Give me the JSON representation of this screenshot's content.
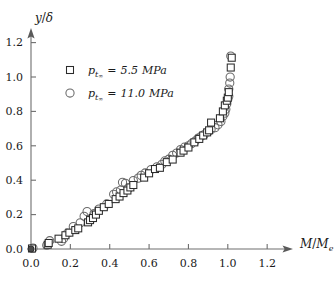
{
  "chart_data": {
    "type": "scatter",
    "title": "",
    "xlabel": "M/M_e",
    "ylabel": "y/δ",
    "xlim": [
      0.0,
      1.3
    ],
    "ylim": [
      0.0,
      1.27
    ],
    "xticks": [
      "0.0",
      "0.2",
      "0.4",
      "0.6",
      "0.8",
      "1.0",
      "1.2"
    ],
    "xtick_values": [
      0.0,
      0.2,
      0.4,
      0.6,
      0.8,
      1.0,
      1.2
    ],
    "yticks": [
      "0.0",
      "0.2",
      "0.4",
      "0.6",
      "0.8",
      "1.0",
      "1.2"
    ],
    "ytick_values": [
      0.0,
      0.2,
      0.4,
      0.6,
      0.8,
      1.0,
      1.2
    ],
    "grid": false,
    "legend_position": "upper-left",
    "axis_style": "arrow-terminated",
    "series": [
      {
        "name": "p_t∞ = 5.5 MPa",
        "marker": "open-square",
        "points": [
          [
            0.005,
            0.003
          ],
          [
            0.085,
            0.025
          ],
          [
            0.09,
            0.035
          ],
          [
            0.14,
            0.06
          ],
          [
            0.175,
            0.08
          ],
          [
            0.195,
            0.095
          ],
          [
            0.225,
            0.11
          ],
          [
            0.24,
            0.12
          ],
          [
            0.29,
            0.155
          ],
          [
            0.3,
            0.168
          ],
          [
            0.315,
            0.18
          ],
          [
            0.33,
            0.2
          ],
          [
            0.345,
            0.222
          ],
          [
            0.37,
            0.243
          ],
          [
            0.395,
            0.262
          ],
          [
            0.43,
            0.29
          ],
          [
            0.45,
            0.305
          ],
          [
            0.47,
            0.325
          ],
          [
            0.49,
            0.34
          ],
          [
            0.505,
            0.358
          ],
          [
            0.52,
            0.372
          ],
          [
            0.575,
            0.415
          ],
          [
            0.6,
            0.44
          ],
          [
            0.63,
            0.465
          ],
          [
            0.655,
            0.472
          ],
          [
            0.69,
            0.505
          ],
          [
            0.72,
            0.52
          ],
          [
            0.76,
            0.56
          ],
          [
            0.775,
            0.572
          ],
          [
            0.8,
            0.59
          ],
          [
            0.83,
            0.62
          ],
          [
            0.855,
            0.64
          ],
          [
            0.875,
            0.66
          ],
          [
            0.895,
            0.678
          ],
          [
            0.905,
            0.69
          ],
          [
            0.915,
            0.735
          ],
          [
            0.96,
            0.76
          ],
          [
            0.975,
            0.8
          ],
          [
            0.985,
            0.835
          ],
          [
            0.995,
            0.862
          ],
          [
            1.0,
            0.88
          ],
          [
            1.005,
            0.912
          ],
          [
            1.015,
            1.055
          ],
          [
            1.02,
            1.112
          ]
        ]
      },
      {
        "name": "p_t∞ = 11.0 MPa",
        "marker": "open-circle",
        "points": [
          [
            0.01,
            0.005
          ],
          [
            0.08,
            0.022
          ],
          [
            0.095,
            0.048
          ],
          [
            0.155,
            0.045
          ],
          [
            0.165,
            0.06
          ],
          [
            0.185,
            0.092
          ],
          [
            0.215,
            0.13
          ],
          [
            0.25,
            0.152
          ],
          [
            0.27,
            0.19
          ],
          [
            0.285,
            0.218
          ],
          [
            0.305,
            0.175
          ],
          [
            0.32,
            0.205
          ],
          [
            0.345,
            0.232
          ],
          [
            0.385,
            0.262
          ],
          [
            0.42,
            0.318
          ],
          [
            0.435,
            0.332
          ],
          [
            0.455,
            0.342
          ],
          [
            0.465,
            0.388
          ],
          [
            0.48,
            0.382
          ],
          [
            0.495,
            0.352
          ],
          [
            0.52,
            0.398
          ],
          [
            0.545,
            0.412
          ],
          [
            0.56,
            0.428
          ],
          [
            0.58,
            0.442
          ],
          [
            0.61,
            0.462
          ],
          [
            0.64,
            0.478
          ],
          [
            0.665,
            0.492
          ],
          [
            0.68,
            0.512
          ],
          [
            0.7,
            0.522
          ],
          [
            0.72,
            0.545
          ],
          [
            0.74,
            0.558
          ],
          [
            0.76,
            0.578
          ],
          [
            0.78,
            0.592
          ],
          [
            0.8,
            0.6
          ],
          [
            0.815,
            0.612
          ],
          [
            0.835,
            0.628
          ],
          [
            0.85,
            0.645
          ],
          [
            0.865,
            0.655
          ],
          [
            0.88,
            0.665
          ],
          [
            0.9,
            0.682
          ],
          [
            0.915,
            0.695
          ],
          [
            0.935,
            0.705
          ],
          [
            0.95,
            0.722
          ],
          [
            0.965,
            0.742
          ],
          [
            0.975,
            0.772
          ],
          [
            0.985,
            0.79
          ],
          [
            0.99,
            0.812
          ],
          [
            0.995,
            0.845
          ],
          [
            1.0,
            0.87
          ],
          [
            1.005,
            0.888
          ],
          [
            1.005,
            0.93
          ],
          [
            1.01,
            0.965
          ],
          [
            1.012,
            1.0
          ],
          [
            1.015,
            1.122
          ]
        ]
      }
    ]
  },
  "legend": {
    "entries": [
      {
        "marker": "open-square",
        "symbol": "p",
        "subscript": "t",
        "subsubscript": "∞",
        "equals": "=",
        "value": "5.5",
        "unit": "MPa"
      },
      {
        "marker": "open-circle",
        "symbol": "p",
        "subscript": "t",
        "subsubscript": "∞",
        "equals": "=",
        "value": "11.0",
        "unit": "MPa"
      }
    ]
  },
  "axis_labels": {
    "y_numerator": "y",
    "y_slash": "/",
    "y_denominator": "δ",
    "x_numerator": "M",
    "x_slash": "/",
    "x_denominator": "M",
    "x_denominator_sub": "e"
  }
}
